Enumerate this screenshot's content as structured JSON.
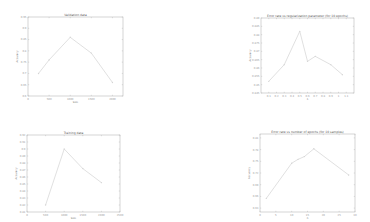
{
  "chart_data": [
    {
      "type": "line",
      "title": "Validation data",
      "xlabel": "Size",
      "ylabel": "Accuracy",
      "x": [
        250,
        500,
        1000,
        1500,
        2000
      ],
      "values": [
        0.7,
        0.76,
        0.86,
        0.79,
        0.66
      ],
      "xticks": [
        0,
        500,
        1000,
        1500,
        2000
      ],
      "yticks": [
        0.6,
        0.65,
        0.7,
        0.75,
        0.8,
        0.85,
        0.9,
        0.95
      ],
      "xlim": [
        0,
        2250
      ],
      "ylim": [
        0.6,
        0.95
      ],
      "grid": false,
      "frame": {
        "x": 28,
        "y": 17,
        "w": 95,
        "h": 79
      }
    },
    {
      "type": "line",
      "title": "Error rate vs regularization parameter (for 10 epochs)",
      "xlabel": "λ",
      "ylabel": "Accuracy",
      "x": [
        0.1,
        0.3,
        0.5,
        0.6,
        0.7,
        0.9,
        1.05
      ],
      "values": [
        0.852,
        0.862,
        0.882,
        0.864,
        0.867,
        0.862,
        0.856
      ],
      "xticks": [
        0.1,
        0.2,
        0.3,
        0.4,
        0.5,
        0.6,
        0.7,
        0.8,
        0.9,
        1.0,
        1.1
      ],
      "yticks": [
        0.845,
        0.85,
        0.855,
        0.86,
        0.865,
        0.87,
        0.875,
        0.88,
        0.885,
        0.89
      ],
      "xlim": [
        0.0,
        1.2
      ],
      "ylim": [
        0.845,
        0.89
      ],
      "grid": false,
      "frame": {
        "x": 261,
        "y": 18,
        "w": 93,
        "h": 75
      }
    },
    {
      "type": "line",
      "title": "Training data",
      "xlabel": "Size",
      "ylabel": "Accuracy",
      "x": [
        500,
        1000,
        1500,
        2000
      ],
      "values": [
        0.82,
        0.9,
        0.872,
        0.852
      ],
      "xticks": [
        0,
        500,
        1000,
        1500,
        2000,
        2500
      ],
      "yticks": [
        0.81,
        0.82,
        0.83,
        0.84,
        0.85,
        0.86,
        0.87,
        0.88,
        0.89,
        0.9,
        0.91,
        0.92
      ],
      "xlim": [
        0,
        2500
      ],
      "ylim": [
        0.81,
        0.92
      ],
      "grid": false,
      "frame": {
        "x": 27,
        "y": 135,
        "w": 93,
        "h": 77
      }
    },
    {
      "type": "line",
      "title": "Error rate vs number of epochs (for 10 samples)",
      "xlabel": "n",
      "ylabel": "Accuracy",
      "x": [
        2,
        10,
        12,
        14,
        17,
        28
      ],
      "values": [
        0.655,
        0.745,
        0.755,
        0.762,
        0.782,
        0.715
      ],
      "xticks": [
        0,
        5,
        10,
        15,
        20,
        25,
        30,
        35,
        40
      ],
      "yticks": [
        0.63,
        0.66,
        0.69,
        0.72,
        0.75,
        0.78,
        0.81,
        0.84
      ],
      "xlim": [
        0,
        30
      ],
      "ylim": [
        0.62,
        0.82
      ],
      "grid": false,
      "frame": {
        "x": 260,
        "y": 134,
        "w": 95,
        "h": 78
      }
    }
  ]
}
